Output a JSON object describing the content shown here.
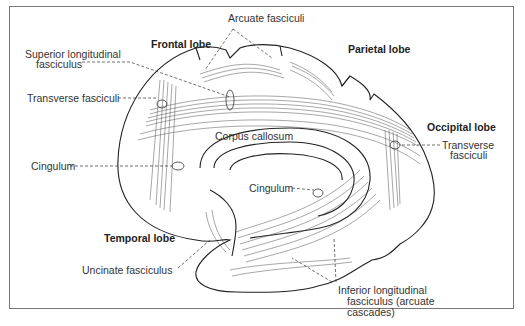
{
  "diagram": {
    "type": "anatomical-illustration",
    "lobes": [
      {
        "id": "frontal",
        "label": "Frontal lobe"
      },
      {
        "id": "parietal",
        "label": "Parietal lobe"
      },
      {
        "id": "occipital",
        "label": "Occipital lobe"
      },
      {
        "id": "temporal",
        "label": "Temporal lobe"
      }
    ],
    "tracts": [
      {
        "id": "arcuate",
        "label": "Arcuate fasciculi"
      },
      {
        "id": "slf",
        "label_line1": "Superior longitudinal",
        "label_line2": "fasciculus"
      },
      {
        "id": "transverse-left",
        "label": "Transverse fasciculi"
      },
      {
        "id": "corpus-callosum",
        "label": "Corpus callosum"
      },
      {
        "id": "cingulum-left",
        "label": "Cingulum"
      },
      {
        "id": "cingulum-center",
        "label": "Cingulum"
      },
      {
        "id": "transverse-right",
        "label_line1": "Transverse",
        "label_line2": "fasciculi"
      },
      {
        "id": "uncinate",
        "label": "Uncinate fasciculus"
      },
      {
        "id": "ilf",
        "label_line1": "Inferior longitudinal",
        "label_line2": "fasciculus (arcuate",
        "label_line3": "cascades)"
      }
    ]
  }
}
